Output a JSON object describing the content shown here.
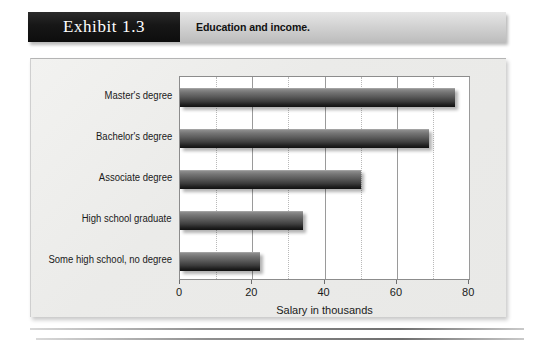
{
  "header": {
    "exhibit_tag": "Exhibit 1.3",
    "title": "Education and income."
  },
  "chart_data": {
    "type": "bar",
    "orientation": "horizontal",
    "title": "Education and income.",
    "xlabel": "Salary in thousands",
    "ylabel": "",
    "categories": [
      "Master's degree",
      "Bachelor's degree",
      "Associate degree",
      "High school graduate",
      "Some high school, no degree"
    ],
    "values": [
      76,
      69,
      50,
      34,
      22
    ],
    "xlim": [
      0,
      80.5
    ],
    "xticks": [
      0,
      20,
      40,
      60,
      80
    ],
    "xtick_labels": [
      "0",
      "20",
      "40",
      "60",
      "80"
    ],
    "grid": "vertical-solid-and-dotted-minor",
    "legend": "none",
    "bar_color": "#3d3d3d",
    "plot_background": "#ffffff",
    "panel_background": "#ebebe9"
  }
}
